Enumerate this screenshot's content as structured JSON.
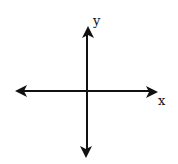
{
  "diagram": {
    "type": "cartesian-axes",
    "axes": {
      "x_label": "x",
      "y_label": "y"
    },
    "colors": {
      "axis": "#111111",
      "background": "#ffffff"
    }
  }
}
